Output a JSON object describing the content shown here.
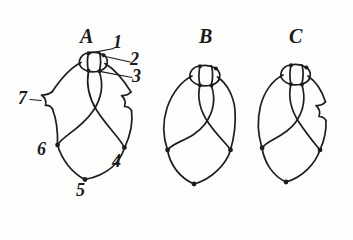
{
  "figure": {
    "title": "",
    "ink_color": "#1d1d1d",
    "background_color": "#fdfdfc",
    "panels": [
      {
        "id": "A",
        "letter": "A"
      },
      {
        "id": "B",
        "letter": "B"
      },
      {
        "id": "C",
        "letter": "C"
      }
    ],
    "callouts": [
      {
        "id": "1",
        "label": "1"
      },
      {
        "id": "2",
        "label": "2"
      },
      {
        "id": "3",
        "label": "3"
      },
      {
        "id": "4",
        "label": "4"
      },
      {
        "id": "5",
        "label": "5"
      },
      {
        "id": "6",
        "label": "6"
      },
      {
        "id": "7",
        "label": "7"
      }
    ]
  }
}
